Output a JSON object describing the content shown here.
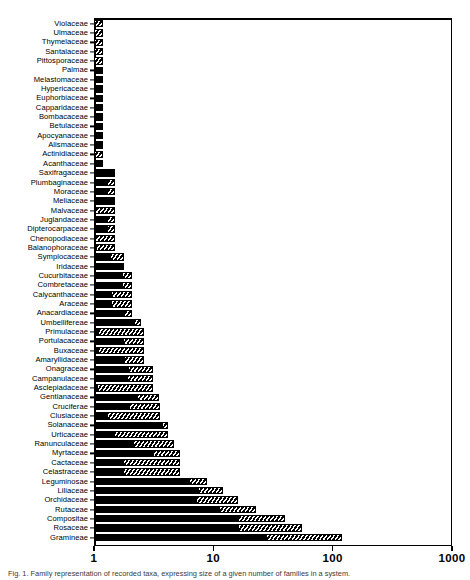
{
  "chart_data": {
    "type": "bar",
    "orientation": "horizontal",
    "title": "",
    "subtitle": "",
    "xlabel": "",
    "ylabel": "",
    "xscale": "log",
    "xlim": [
      1,
      1000
    ],
    "xticks": [
      1,
      10,
      100,
      1000
    ],
    "xticklabels": [
      "1",
      "10",
      "100",
      "1000"
    ],
    "grid": false,
    "legend": null,
    "categories": [
      "Violaceae",
      "Ulmaceae",
      "Thymelaceae",
      "Santalaceae",
      "Pittosporaceae",
      "Palmae",
      "Melastomaceae",
      "Hypericaceae",
      "Euphorbiaceae",
      "Capparidaceae",
      "Bombacaceae",
      "Betulaceae",
      "Apocyanaceae",
      "Alismaceae",
      "Actinidiaceae",
      "Acanthaceae",
      "Saxifragaceae",
      "Plumbaginaceae",
      "Moraceae",
      "Meliaceae",
      "Malvaceae",
      "Juglandaceae",
      "Dipterocarpaceae",
      "Chenopodiaceae",
      "Balanophoraceae",
      "Symplocaceae",
      "Iridaceae",
      "Cucurbitaceae",
      "Combretaceae",
      "Calycanthaceae",
      "Araceae",
      "Anacardiaceae",
      "Umbellifereae",
      "Primulaceae",
      "Portulacaceae",
      "Buxaceae",
      "Amaryllidaceae",
      "Onagraceae",
      "Campanulaceae",
      "Asclepiadaceae",
      "Gentianaceae",
      "Cruciferae",
      "Clusiaceae",
      "Solanaceae",
      "Urticaceae",
      "Ranunculaceae",
      "Myrtaceae",
      "Cactaceae",
      "Celastraceae",
      "Leguminosae",
      "Liliaceae",
      "Orchidaceae",
      "Rutaceae",
      "Compositae",
      "Rosaceae",
      "Gramineae"
    ],
    "values": [
      1.2,
      1.2,
      1.2,
      1.2,
      1.2,
      1.2,
      1.2,
      1.2,
      1.2,
      1.2,
      1.2,
      1.2,
      1.2,
      1.2,
      1.2,
      1.2,
      1.5,
      1.5,
      1.5,
      1.5,
      1.5,
      1.5,
      1.5,
      1.5,
      1.5,
      1.8,
      1.8,
      2.1,
      2.1,
      2.1,
      2.1,
      2.1,
      2.5,
      2.6,
      2.6,
      2.6,
      2.6,
      3.1,
      3.1,
      3.1,
      3.5,
      3.6,
      3.6,
      4.2,
      4.2,
      4.7,
      5.3,
      5.3,
      5.3,
      8.8,
      12.0,
      16.0,
      23.0,
      40.0,
      55.0,
      120.0
    ],
    "hatch_fractions": [
      0.95,
      0.95,
      0.95,
      0.95,
      0.95,
      0.0,
      0.0,
      0.0,
      0.0,
      0.0,
      0.0,
      0.0,
      0.0,
      0.0,
      0.95,
      0.0,
      0.0,
      0.34,
      0.34,
      0.0,
      0.95,
      0.3,
      0.3,
      0.95,
      0.9,
      0.45,
      0.0,
      0.22,
      0.22,
      0.52,
      0.52,
      0.18,
      0.13,
      0.92,
      0.38,
      0.92,
      0.36,
      0.4,
      0.42,
      0.95,
      0.32,
      0.45,
      0.8,
      0.06,
      0.72,
      0.5,
      0.3,
      0.66,
      0.66,
      0.14,
      0.18,
      0.28,
      0.22,
      0.24,
      0.3,
      0.3
    ],
    "series": [
      {
        "name": "Number of species (log scale)",
        "values": [
          1.2,
          1.2,
          1.2,
          1.2,
          1.2,
          1.2,
          1.2,
          1.2,
          1.2,
          1.2,
          1.2,
          1.2,
          1.2,
          1.2,
          1.2,
          1.2,
          1.5,
          1.5,
          1.5,
          1.5,
          1.5,
          1.5,
          1.5,
          1.5,
          1.5,
          1.8,
          1.8,
          2.1,
          2.1,
          2.1,
          2.1,
          2.1,
          2.5,
          2.6,
          2.6,
          2.6,
          2.6,
          3.1,
          3.1,
          3.1,
          3.5,
          3.6,
          3.6,
          4.2,
          4.2,
          4.7,
          5.3,
          5.3,
          5.3,
          8.8,
          12.0,
          16.0,
          23.0,
          40.0,
          55.0,
          120.0
        ]
      }
    ]
  },
  "caption": {
    "text": "Fig. 1. Family representation of recorded taxa, expressing size of a given number of families in a system."
  }
}
